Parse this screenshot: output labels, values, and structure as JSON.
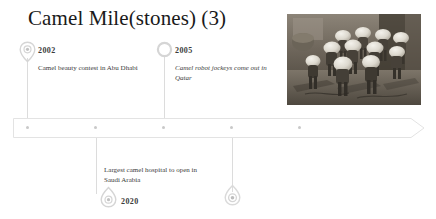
{
  "slide": {
    "title": "Camel Mile(stones) (3)",
    "background_color": "#ffffff",
    "accent_color": "#cfcfcf",
    "text_color": "#3b3b3b"
  },
  "timeline": {
    "axis_label": "timeline-arrow",
    "tick_count": 5,
    "events": [
      {
        "year": "2002",
        "description": "Camel beauty contest in Abu Dhabi",
        "position": "above",
        "marker": "map-pin",
        "italic": false
      },
      {
        "year": "2005",
        "description": "Camel robot jockeys come out in Qatar",
        "position": "above",
        "marker": "ring",
        "italic": true
      },
      {
        "year": "2020",
        "description": "Largest camel hospital to open in Saudi Arabia",
        "position": "below",
        "marker": "map-pin",
        "italic": false
      },
      {
        "year": "",
        "description": "",
        "position": "below",
        "marker": "map-pin",
        "italic": false
      }
    ]
  },
  "photo": {
    "caption": "camel-robot-jockeys-photo",
    "alt": "Row of camel robot jockeys with white helmets"
  }
}
